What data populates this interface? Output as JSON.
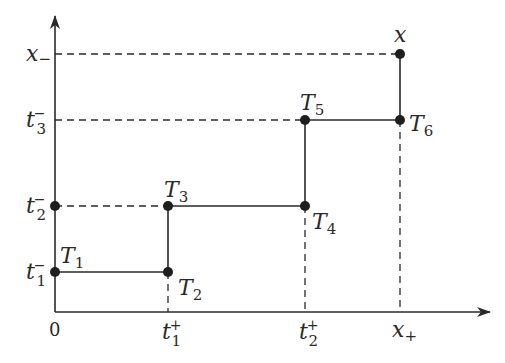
{
  "diagram": {
    "type": "step-path",
    "colors": {
      "ink": "#2a2a2a",
      "background": "#ffffff"
    },
    "axes": {
      "origin_label": "0",
      "x_ticks": [
        {
          "id": "t1plus",
          "base": "t",
          "sub": "1",
          "sup": "+"
        },
        {
          "id": "t2plus",
          "base": "t",
          "sub": "2",
          "sup": "+"
        },
        {
          "id": "xplus",
          "base": "x",
          "sub": "+",
          "sup": ""
        }
      ],
      "y_ticks": [
        {
          "id": "t1minus",
          "base": "t",
          "sub": "1",
          "sup": "−"
        },
        {
          "id": "t2minus",
          "base": "t",
          "sub": "2",
          "sup": "−"
        },
        {
          "id": "t3minus",
          "base": "t",
          "sub": "3",
          "sup": "−"
        },
        {
          "id": "xminus",
          "base": "x",
          "sub": "−",
          "sup": ""
        }
      ]
    },
    "points": [
      {
        "id": "T1",
        "base": "T",
        "sub": "1"
      },
      {
        "id": "T2",
        "base": "T",
        "sub": "2"
      },
      {
        "id": "T3",
        "base": "T",
        "sub": "3"
      },
      {
        "id": "T4",
        "base": "T",
        "sub": "4"
      },
      {
        "id": "T5",
        "base": "T",
        "sub": "5"
      },
      {
        "id": "T6",
        "base": "T",
        "sub": "6"
      },
      {
        "id": "x",
        "base": "x",
        "sub": ""
      }
    ],
    "path_order": [
      "T1",
      "T2",
      "T3",
      "T4",
      "T5",
      "T6",
      "x"
    ]
  }
}
